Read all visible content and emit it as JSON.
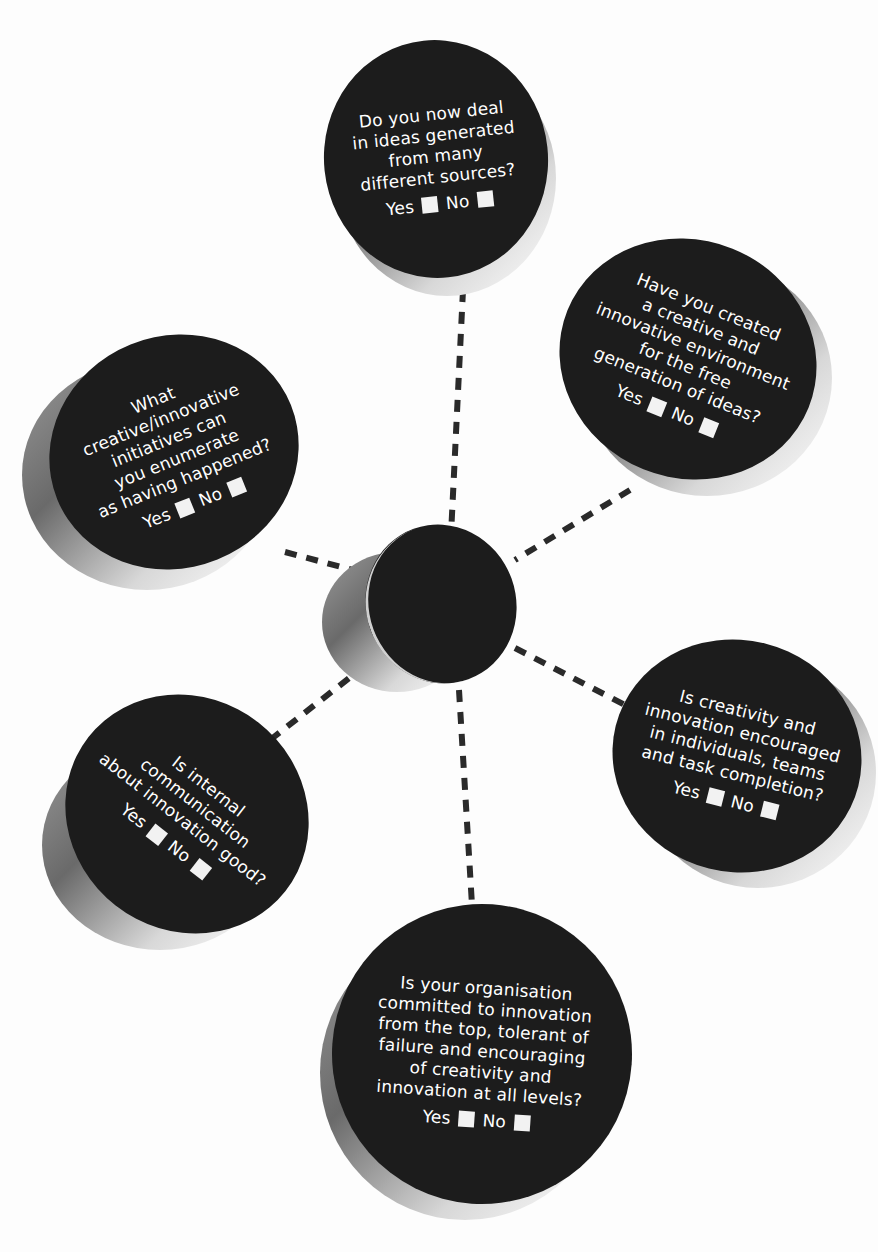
{
  "diagram": {
    "type": "hub-and-spoke checklist",
    "hub": {
      "label": ""
    },
    "questions": [
      {
        "id": "top",
        "text": "Do you now deal\nin ideas generated\nfrom many\ndifferent sources?",
        "yes_label": "Yes",
        "no_label": "No"
      },
      {
        "id": "upper-right",
        "text": "Have you created\na creative and\ninnovative environment\nfor the free\ngeneration of ideas?",
        "yes_label": "Yes",
        "no_label": "No"
      },
      {
        "id": "upper-left",
        "text": "What\ncreative/innovative\ninitiatives can\nyou enumerate\nas having happened?",
        "yes_label": "Yes",
        "no_label": "No"
      },
      {
        "id": "lower-right",
        "text": "Is creativity and\ninnovation encouraged\nin individuals, teams\nand task completion?",
        "yes_label": "Yes",
        "no_label": "No"
      },
      {
        "id": "lower-left",
        "text": "Is internal\ncommunication\nabout innovation good?",
        "yes_label": "Yes",
        "no_label": "No"
      },
      {
        "id": "bottom",
        "text": "Is your organisation\ncommitted to innovation\nfrom the top, tolerant of\nfailure and encouraging\nof creativity and\ninnovation at all levels?",
        "yes_label": "Yes",
        "no_label": "No"
      }
    ],
    "colors": {
      "disc": "#1c1c1c",
      "text": "#ffffff",
      "connector": "#2a2a2a",
      "background": "#fdfdfd"
    }
  }
}
